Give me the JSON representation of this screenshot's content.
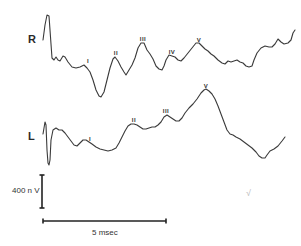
{
  "chart_data": {
    "type": "line",
    "title": "",
    "series": [
      {
        "name": "R",
        "label_position": [
          28,
          33
        ],
        "points": [
          [
            43,
            40
          ],
          [
            45,
            25
          ],
          [
            47,
            15
          ],
          [
            49,
            16
          ],
          [
            50,
            30
          ],
          [
            52,
            58
          ],
          [
            54,
            60
          ],
          [
            56,
            57
          ],
          [
            58,
            60
          ],
          [
            60,
            61
          ],
          [
            63,
            56
          ],
          [
            65,
            57
          ],
          [
            68,
            62
          ],
          [
            72,
            67
          ],
          [
            76,
            68
          ],
          [
            80,
            67
          ],
          [
            84,
            65
          ],
          [
            87,
            68
          ],
          [
            90,
            72
          ],
          [
            93,
            80
          ],
          [
            96,
            90
          ],
          [
            99,
            96
          ],
          [
            101,
            97
          ],
          [
            104,
            92
          ],
          [
            107,
            80
          ],
          [
            110,
            68
          ],
          [
            113,
            59
          ],
          [
            115,
            57
          ],
          [
            118,
            61
          ],
          [
            121,
            67
          ],
          [
            124,
            72
          ],
          [
            126,
            75
          ],
          [
            129,
            70
          ],
          [
            132,
            65
          ],
          [
            135,
            58
          ],
          [
            138,
            48
          ],
          [
            141,
            43
          ],
          [
            144,
            43
          ],
          [
            147,
            50
          ],
          [
            150,
            54
          ],
          [
            153,
            59
          ],
          [
            156,
            66
          ],
          [
            159,
            69
          ],
          [
            162,
            70
          ],
          [
            164,
            66
          ],
          [
            166,
            60
          ],
          [
            169,
            55
          ],
          [
            172,
            56
          ],
          [
            175,
            57
          ],
          [
            178,
            60
          ],
          [
            181,
            61
          ],
          [
            184,
            58
          ],
          [
            188,
            53
          ],
          [
            192,
            48
          ],
          [
            196,
            43
          ],
          [
            199,
            43
          ],
          [
            202,
            46
          ],
          [
            205,
            49
          ],
          [
            208,
            51
          ],
          [
            211,
            54
          ],
          [
            214,
            56
          ],
          [
            218,
            60
          ],
          [
            222,
            63
          ],
          [
            225,
            64
          ],
          [
            228,
            61
          ],
          [
            231,
            62
          ],
          [
            234,
            61
          ],
          [
            237,
            60
          ],
          [
            240,
            62
          ],
          [
            243,
            63
          ],
          [
            246,
            66
          ],
          [
            249,
            67
          ],
          [
            252,
            66
          ],
          [
            254,
            60
          ],
          [
            257,
            53
          ],
          [
            261,
            48
          ],
          [
            265,
            46
          ],
          [
            269,
            47
          ],
          [
            272,
            47
          ],
          [
            275,
            44
          ],
          [
            278,
            39
          ],
          [
            281,
            42
          ],
          [
            284,
            44
          ],
          [
            288,
            43
          ],
          [
            291,
            40
          ],
          [
            293,
            33
          ],
          [
            295,
            30
          ]
        ],
        "peaks": [
          {
            "label": "I",
            "x": 88,
            "y": 58
          },
          {
            "label": "II",
            "x": 116,
            "y": 50
          },
          {
            "label": "III",
            "x": 143,
            "y": 36
          },
          {
            "label": "IV",
            "x": 172,
            "y": 49
          },
          {
            "label": "V",
            "x": 199,
            "y": 37
          }
        ]
      },
      {
        "name": "L",
        "label_position": [
          28,
          130
        ],
        "points": [
          [
            43,
            134
          ],
          [
            44,
            128
          ],
          [
            45,
            122
          ],
          [
            46,
            125
          ],
          [
            47,
            150
          ],
          [
            48,
            163
          ],
          [
            49,
            165
          ],
          [
            50,
            160
          ],
          [
            51,
            140
          ],
          [
            53,
            130
          ],
          [
            56,
            128
          ],
          [
            59,
            130
          ],
          [
            62,
            130
          ],
          [
            65,
            133
          ],
          [
            68,
            137
          ],
          [
            71,
            141
          ],
          [
            74,
            145
          ],
          [
            77,
            146
          ],
          [
            80,
            143
          ],
          [
            83,
            140
          ],
          [
            86,
            140
          ],
          [
            89,
            142
          ],
          [
            92,
            144
          ],
          [
            96,
            147
          ],
          [
            100,
            149
          ],
          [
            104,
            150
          ],
          [
            108,
            151
          ],
          [
            112,
            150
          ],
          [
            116,
            148
          ],
          [
            119,
            143
          ],
          [
            122,
            137
          ],
          [
            125,
            131
          ],
          [
            128,
            126
          ],
          [
            131,
            124
          ],
          [
            134,
            124
          ],
          [
            137,
            125
          ],
          [
            140,
            127
          ],
          [
            143,
            129
          ],
          [
            146,
            129
          ],
          [
            149,
            128
          ],
          [
            152,
            127
          ],
          [
            155,
            127
          ],
          [
            158,
            125
          ],
          [
            161,
            122
          ],
          [
            164,
            117
          ],
          [
            167,
            115
          ],
          [
            170,
            117
          ],
          [
            173,
            119
          ],
          [
            176,
            121
          ],
          [
            179,
            121
          ],
          [
            182,
            118
          ],
          [
            185,
            113
          ],
          [
            189,
            108
          ],
          [
            193,
            104
          ],
          [
            197,
            99
          ],
          [
            201,
            93
          ],
          [
            204,
            90
          ],
          [
            206,
            89
          ],
          [
            209,
            91
          ],
          [
            212,
            94
          ],
          [
            215,
            99
          ],
          [
            218,
            106
          ],
          [
            221,
            114
          ],
          [
            224,
            122
          ],
          [
            227,
            130
          ],
          [
            230,
            134
          ],
          [
            233,
            135
          ],
          [
            236,
            137
          ],
          [
            240,
            139
          ],
          [
            244,
            142
          ],
          [
            248,
            145
          ],
          [
            252,
            148
          ],
          [
            256,
            152
          ],
          [
            259,
            156
          ],
          [
            262,
            158
          ],
          [
            265,
            158
          ],
          [
            267,
            155
          ],
          [
            270,
            151
          ],
          [
            274,
            149
          ],
          [
            278,
            146
          ],
          [
            282,
            141
          ],
          [
            285,
            137
          ]
        ],
        "peaks": [
          {
            "label": "I",
            "x": 90,
            "y": 136
          },
          {
            "label": "II",
            "x": 134,
            "y": 117
          },
          {
            "label": "III",
            "x": 166,
            "y": 108
          },
          {
            "label": "V",
            "x": 206,
            "y": 83
          }
        ]
      }
    ],
    "scale_bars": {
      "vertical": {
        "label": "400 n V",
        "x": 42,
        "y1": 175,
        "y2": 208
      },
      "horizontal": {
        "label": "5 msec",
        "x1": 43,
        "x2": 166,
        "y": 221
      }
    },
    "xlabel": "",
    "ylabel": "",
    "grid": false,
    "legend": "none"
  },
  "labels": {
    "right": "R",
    "left": "L",
    "voltage_scale": "400 n V",
    "time_scale": "5 msec",
    "handwritten_mark": "√"
  }
}
